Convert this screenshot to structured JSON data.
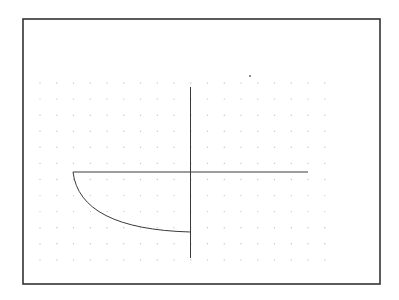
{
  "canvas": {
    "width": 399,
    "height": 300,
    "background": "#ffffff"
  },
  "frame": {
    "x": 23,
    "y": 19,
    "width": 357,
    "height": 265,
    "stroke": "#333333",
    "stroke_width": 1.6
  },
  "dot_grid": {
    "x_start": 40,
    "y_start": 83,
    "step": 16.75,
    "columns": 18,
    "rows": 12,
    "radius": 0.7,
    "color": "#c4c4c4"
  },
  "stray_mark": {
    "x": 250,
    "y": 76,
    "radius": 0.9,
    "color": "#555555"
  },
  "shapes": {
    "color": "#3a3a3a",
    "stroke_width": 1,
    "vertical_line": {
      "x": 190.5,
      "y1": 87,
      "y2": 258
    },
    "horizontal_line": {
      "x1": 73,
      "x2": 308,
      "y": 172
    },
    "arc": {
      "start": {
        "x": 73,
        "y": 172
      },
      "control": {
        "x": 80,
        "y": 229
      },
      "end": {
        "x": 190.5,
        "y": 232
      }
    }
  }
}
